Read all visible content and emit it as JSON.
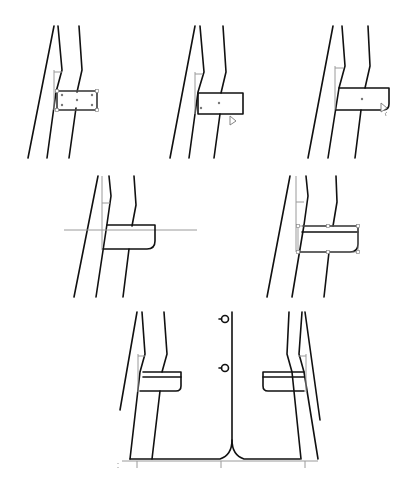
{
  "diagram": {
    "type": "technical-flat-sketch",
    "colors": {
      "line": "#111111",
      "guide": "#9a9a9a",
      "background": "#ffffff"
    },
    "steps": [
      {
        "id": 1,
        "label": "rectangle drawn and selected with handles"
      },
      {
        "id": 2,
        "label": "rectangle placed, cursor at corner"
      },
      {
        "id": 3,
        "label": "corner rounding with cursor"
      },
      {
        "id": 4,
        "label": "flap with rounded corner and horizontal guide"
      },
      {
        "id": 5,
        "label": "flap with top band, selected"
      },
      {
        "id": 6,
        "label": "final jacket front with mirrored pocket flaps and buttons"
      }
    ],
    "icons": [
      "pointer-cursor-icon",
      "corner-round-cursor-icon"
    ]
  }
}
